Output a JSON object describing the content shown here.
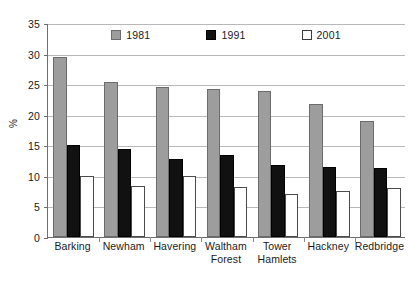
{
  "chart_data": {
    "type": "bar",
    "title": "",
    "subtitle": "",
    "xlabel": "",
    "ylabel": "%",
    "ylim": [
      0,
      35
    ],
    "ytick_step": 5,
    "yticks": [
      0,
      5,
      10,
      15,
      20,
      25,
      30,
      35
    ],
    "ytick_labels": [
      "0",
      "5",
      "10",
      "15",
      "20",
      "25",
      "30",
      "35"
    ],
    "grid": "horizontal",
    "legend_position": "top-inside",
    "categories": [
      "Barking",
      "Newham",
      "Havering",
      "Waltham Forest",
      "Tower Hamlets",
      "Hackney",
      "Redbridge"
    ],
    "category_lines": [
      [
        "Barking"
      ],
      [
        "Newham"
      ],
      [
        "Havering"
      ],
      [
        "Waltham",
        "Forest"
      ],
      [
        "Tower",
        "Hamlets"
      ],
      [
        "Hackney"
      ],
      [
        "Redbridge"
      ]
    ],
    "series": [
      {
        "name": "1981",
        "color": "#9d9d9d",
        "edge_color": "#6b6b6b",
        "values": [
          29.5,
          25.3,
          24.5,
          24.2,
          23.9,
          21.7,
          19.0
        ]
      },
      {
        "name": "1991",
        "color": "#111111",
        "edge_color": "#000000",
        "values": [
          15.0,
          14.4,
          12.7,
          13.4,
          11.7,
          11.4,
          11.3
        ]
      },
      {
        "name": "2001",
        "color": "#ffffff",
        "edge_color": "#4a4a4a",
        "values": [
          10.0,
          8.3,
          9.9,
          8.2,
          7.0,
          7.6,
          8.0
        ]
      }
    ]
  },
  "legend": {
    "entries": [
      {
        "label": "1981",
        "swatch": "gray-filled-square-icon"
      },
      {
        "label": "1991",
        "swatch": "black-filled-square-icon"
      },
      {
        "label": "2001",
        "swatch": "white-outlined-square-icon"
      }
    ]
  },
  "axes": {
    "y_title": "%"
  },
  "colors": {
    "series_1981": "#9d9d9d",
    "series_1991": "#111111",
    "series_2001": "#ffffff",
    "gridline": "#b8b8b8",
    "axis": "#6e6e6e",
    "text": "#1a1a1a",
    "background": "#ffffff"
  }
}
